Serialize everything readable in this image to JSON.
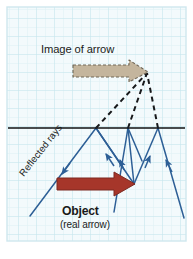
{
  "figure": {
    "background_color": "#ffffff",
    "paper_color": "#f4fbfc",
    "grid": {
      "minor_color": "#dcf0f4",
      "major_color": "#c3e6ee",
      "minor_spacing_px": 9,
      "major_spacing_px": 18,
      "visible": true
    },
    "border_color": "#cfe7ee",
    "plot_area": {
      "x": 8,
      "y": 8,
      "width": 177,
      "height": 232
    }
  },
  "labels": {
    "image_of_arrow": "Image of arrow",
    "reflected_rays": "Reflected rays",
    "object": "Object",
    "real_arrow": "(real arrow)"
  },
  "mirror": {
    "name": "mirror-line",
    "color": "#111111",
    "y": 128,
    "x_start": 8,
    "x_end": 185,
    "thickness_px": 1.6
  },
  "object_arrow": {
    "label": "Object (real arrow)",
    "fill_color": "#a8372a",
    "stroke_color": "#7e2a20",
    "tail_x": 57,
    "tail_y": 184,
    "tip_x": 134,
    "tip_y": 184,
    "shaft_half_height": 6,
    "head_half_height": 12,
    "head_length": 20
  },
  "image_arrow": {
    "label": "Image of arrow",
    "fill_color": "#c3b49c",
    "stroke_color": "#7d7260",
    "stroke_dash": "3 2",
    "tail_x": 73,
    "tail_y": 70,
    "tip_x": 148,
    "tip_y": 72,
    "shaft_half_height": 5,
    "head_half_height": 10,
    "head_length": 19
  },
  "rays": {
    "color": "#2d5f96",
    "dashed_color": "#17181a",
    "dash_pattern": "5 4",
    "incident_rays": [
      {
        "name": "incident-ray-1",
        "from_x": 134,
        "from_y": 184,
        "to_x": 96,
        "to_y": 128
      },
      {
        "name": "incident-ray-2",
        "from_x": 134,
        "from_y": 184,
        "to_x": 128,
        "to_y": 128
      },
      {
        "name": "incident-ray-3",
        "from_x": 134,
        "from_y": 184,
        "to_x": 158,
        "to_y": 128
      }
    ],
    "reflected_rays": [
      {
        "name": "reflected-ray-1",
        "from_x": 96,
        "from_y": 128,
        "to_x": 30,
        "to_y": 216,
        "arrow_at": 0.55
      },
      {
        "name": "reflected-ray-2",
        "from_x": 128,
        "from_y": 128,
        "to_x": 114,
        "to_y": 212,
        "arrow_at": 0.5
      },
      {
        "name": "reflected-ray-3",
        "from_x": 158,
        "from_y": 128,
        "to_x": 184,
        "to_y": 218,
        "arrow_at": 0.42
      }
    ],
    "extra_reflected_short": [
      {
        "name": "reflected-ray-arrowlet-1",
        "from_x": 96,
        "from_y": 128,
        "to_x": 122,
        "to_y": 165,
        "arrow_at": 0.72
      },
      {
        "name": "reflected-ray-arrowlet-2",
        "from_x": 128,
        "from_y": 128,
        "to_x": 141,
        "to_y": 160,
        "arrow_at": 0.78
      }
    ],
    "virtual_rays": [
      {
        "name": "virtual-ray-1",
        "from_x": 96,
        "from_y": 128,
        "to_x": 147,
        "to_y": 73
      },
      {
        "name": "virtual-ray-2",
        "from_x": 128,
        "from_y": 128,
        "to_x": 147,
        "to_y": 73
      },
      {
        "name": "virtual-ray-3",
        "from_x": 158,
        "from_y": 128,
        "to_x": 147,
        "to_y": 73
      }
    ],
    "convergence_point": {
      "x": 147,
      "y": 73
    }
  }
}
